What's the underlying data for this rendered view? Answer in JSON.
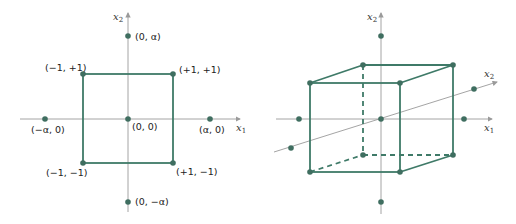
{
  "colors": {
    "axis": "#9a9a9a",
    "shape": "#3f7a68",
    "point": "#3f6e60",
    "text": "#222222"
  },
  "left_diagram": {
    "axis_x_label": "x",
    "axis_x_sub": "1",
    "axis_y_label": "x",
    "axis_y_sub": "2",
    "points": [
      {
        "label": "(0, α)"
      },
      {
        "label": "(−1, +1)"
      },
      {
        "label": "(+1, +1)"
      },
      {
        "label": "(−α, 0)"
      },
      {
        "label": "(0, 0)"
      },
      {
        "label": "(α, 0)"
      },
      {
        "label": "(−1, −1)"
      },
      {
        "label": "(+1, −1)"
      },
      {
        "label": "(0, −α)"
      }
    ]
  },
  "right_diagram": {
    "axis_x_label": "x",
    "axis_x_sub": "1",
    "axis_y_label": "x",
    "axis_y_sub": "2",
    "axis_z_label": "x",
    "axis_z_sub": "2"
  }
}
